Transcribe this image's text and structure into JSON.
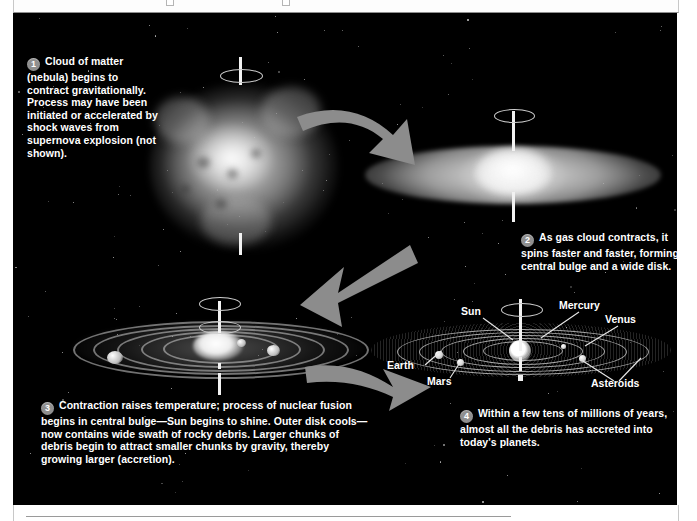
{
  "toolbar": {
    "faint_text": "Printed from e-book",
    "visible": true
  },
  "figure": {
    "background_color": "#000000",
    "accent_color": "#8f8f8f",
    "text_color": "#ffffff"
  },
  "steps": [
    {
      "number": "1",
      "text": "Cloud of matter (nebula) begins to contract gravitationally. Process may have been initiated or accelerated by shock waves from supernova explosion (not shown)."
    },
    {
      "number": "2",
      "text": "As gas cloud contracts, it spins faster and faster, forming a central bulge and a wide disk."
    },
    {
      "number": "3",
      "text": "Contraction raises temperature; process of nuclear fusion begins in central bulge—Sun begins to shine. Outer disk cools—now contains wide swath of rocky debris. Larger chunks of debris begin to attract smaller chunks by gravity, thereby growing larger (accretion)."
    },
    {
      "number": "4",
      "text": "Within a few tens of millions of years, almost all the debris has accreted into today's planets."
    }
  ],
  "panels": [
    {
      "id": "panel-nebula",
      "caption": "Contracting nebula cloud with rotation axis"
    },
    {
      "id": "panel-disk",
      "caption": "Flattened spinning disk with central bulge"
    },
    {
      "id": "panel-rings",
      "caption": "Protoplanetary disk with concentric rings of debris"
    },
    {
      "id": "panel-solar-system",
      "caption": "Formed solar system with planets and asteroid belt"
    }
  ],
  "solar_system_labels": [
    {
      "name": "Sun"
    },
    {
      "name": "Mercury"
    },
    {
      "name": "Venus"
    },
    {
      "name": "Earth"
    },
    {
      "name": "Mars"
    },
    {
      "name": "Asteroids"
    }
  ],
  "arrows": [
    {
      "id": "arrow-1-to-2",
      "direction": "right-down"
    },
    {
      "id": "arrow-2-to-3",
      "direction": "down-left"
    },
    {
      "id": "arrow-3-to-4",
      "direction": "right"
    }
  ]
}
